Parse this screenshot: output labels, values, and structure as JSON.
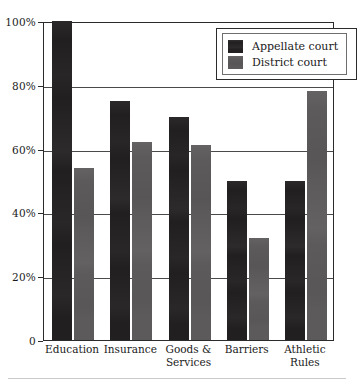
{
  "chart_data": {
    "type": "bar",
    "title": "",
    "subtitle": "",
    "xlabel": "",
    "ylabel": "",
    "ylim": [
      0,
      100
    ],
    "grid": true,
    "legend_position": "top-right-inside",
    "categories": [
      "Education",
      "Insurance",
      "Goods &\nServices",
      "Barriers",
      "Athletic\nRules"
    ],
    "category_lines": [
      [
        "Education"
      ],
      [
        "Insurance"
      ],
      [
        "Goods &",
        "Services"
      ],
      [
        "Barriers"
      ],
      [
        "Athletic",
        "Rules"
      ]
    ],
    "series": [
      {
        "name": "Appellate court",
        "color": "#211f20",
        "values": [
          100,
          75,
          70,
          50,
          50
        ]
      },
      {
        "name": "District court",
        "color": "#5c5a5b",
        "values": [
          54,
          62,
          61,
          32,
          78
        ]
      }
    ],
    "y_ticks": [
      {
        "value": 100,
        "label": "100%"
      },
      {
        "value": 80,
        "label": "80%"
      },
      {
        "value": 60,
        "label": "60%"
      },
      {
        "value": 40,
        "label": "40%"
      },
      {
        "value": 20,
        "label": "20%"
      },
      {
        "value": 0,
        "label": "0"
      }
    ]
  },
  "legend": {
    "items": [
      {
        "label": "Appellate court",
        "swatch": "appellate"
      },
      {
        "label": "District court",
        "swatch": "district"
      }
    ]
  }
}
